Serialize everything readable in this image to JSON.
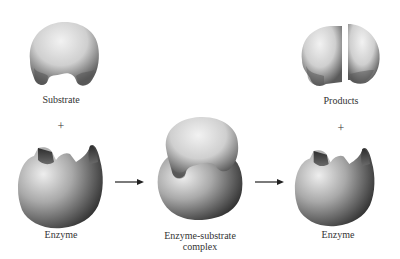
{
  "diagram": {
    "title": "",
    "nodes": {
      "substrate": {
        "label": "Substrate"
      },
      "enzyme_left": {
        "label": "Enzyme"
      },
      "complex": {
        "label_line1": "Enzyme-substrate",
        "label_line2": "complex"
      },
      "products": {
        "label": "Products"
      },
      "enzyme_right": {
        "label": "Enzyme"
      }
    },
    "operators": {
      "plus_left": "+",
      "plus_right": "+"
    },
    "edges": [
      {
        "from": "substrate + enzyme",
        "to": "complex",
        "type": "arrow"
      },
      {
        "from": "complex",
        "to": "products + enzyme",
        "type": "arrow"
      }
    ],
    "colors": {
      "background": "#ffffff",
      "shape_light": "#e4e4e4",
      "shape_mid": "#a8a8a8",
      "shape_dark": "#4a4a4a",
      "arrow": "#222222"
    }
  }
}
